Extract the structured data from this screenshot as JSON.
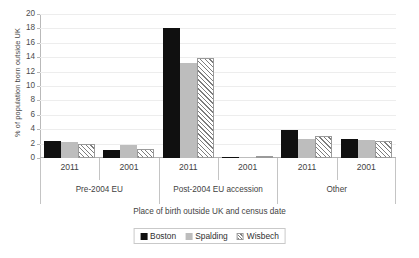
{
  "chart_data": {
    "type": "bar",
    "title": "",
    "xlabel": "Place of birth outside UK and census date",
    "ylabel": "% of population born outside UK",
    "ylim": [
      0,
      20
    ],
    "yticks": [
      0,
      2,
      4,
      6,
      8,
      10,
      12,
      14,
      16,
      18,
      20
    ],
    "grid": true,
    "legend_position": "bottom",
    "categories": [
      "2011",
      "2001",
      "2011",
      "2001",
      "2011",
      "2001"
    ],
    "groups": [
      {
        "label": "Pre-2004 EU",
        "categories": [
          "2011",
          "2001"
        ]
      },
      {
        "label": "Post-2004 EU accession",
        "categories": [
          "2011",
          "2001"
        ]
      },
      {
        "label": "Other",
        "categories": [
          "2011",
          "2001"
        ]
      }
    ],
    "series": [
      {
        "name": "Boston",
        "color": "#101010",
        "values": [
          2.3,
          1.1,
          18.0,
          0.2,
          3.9,
          2.6
        ]
      },
      {
        "name": "Spalding",
        "color": "#bdbdbd",
        "values": [
          2.2,
          1.8,
          13.2,
          0.1,
          2.7,
          2.5
        ]
      },
      {
        "name": "Wisbech",
        "color": "#ffffff",
        "values": [
          2.0,
          1.3,
          13.9,
          0.1,
          3.0,
          2.4
        ]
      }
    ]
  },
  "legend": {
    "items": [
      {
        "label": "Boston"
      },
      {
        "label": "Spalding"
      },
      {
        "label": "Wisbech"
      }
    ]
  }
}
